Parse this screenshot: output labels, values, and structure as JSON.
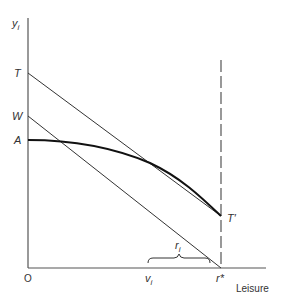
{
  "diagram": {
    "y_axis_label_main": "y",
    "y_axis_label_sub": "i",
    "x_axis_label": "Leisure",
    "origin_label": "O",
    "labels": {
      "T": "T",
      "W": "W",
      "A": "A",
      "T_prime": "T′",
      "r_star": "r*",
      "r_i_main": "r",
      "r_i_sub": "i",
      "v_i_main": "v",
      "v_i_sub": "i"
    },
    "elements": [
      {
        "name": "line-T-to-Tprime",
        "from": "T",
        "to": "T'"
      },
      {
        "name": "line-W-to-rstar",
        "from": "W",
        "to": "r*"
      },
      {
        "name": "curve-A-to-Tprime",
        "from": "A",
        "to": "T'"
      },
      {
        "name": "dashed-vertical-at-rstar",
        "at": "r*"
      },
      {
        "name": "brace-r_i",
        "from": "v_i",
        "to": "r*"
      }
    ]
  }
}
